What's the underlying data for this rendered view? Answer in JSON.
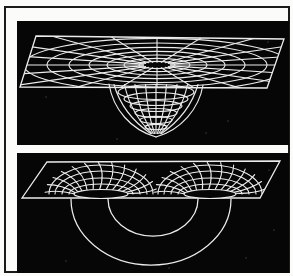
{
  "meta": {
    "kind": "scanned-textbook-figure",
    "visible_text": []
  },
  "colors": {
    "page_background": "#fbfbf9",
    "frame_border": "#1a1a1a",
    "panel_background": "#060606",
    "line": "#ececec",
    "speck": "#3d3d3d"
  },
  "figure": {
    "panels": [
      {
        "name": "gravity-well",
        "size": [
          272,
          124
        ],
        "sheet": [
          [
            19,
            15
          ],
          [
            267,
            18
          ],
          [
            250,
            67
          ],
          [
            3,
            66
          ]
        ],
        "grid_center": [
          140,
          44
        ],
        "grid_flatten": 0.2,
        "grid_radii": [
          18,
          33,
          50,
          68,
          88,
          110,
          133
        ],
        "ray_count": 20,
        "ray_inner": 14,
        "ray_outer": 175,
        "mouth": {
          "cx": 139,
          "cy": 60,
          "rx": 50,
          "ry": 11
        },
        "funnel": {
          "tip": [
            139,
            116
          ],
          "left": [
            92,
            63
          ],
          "right": [
            186,
            64
          ],
          "rings": [
            [
              71,
              38,
              7.5
            ],
            [
              78,
              32,
              6.5
            ],
            [
              85,
              26,
              5.5
            ],
            [
              92,
              21,
              4.5
            ],
            [
              99,
              16,
              3.6
            ],
            [
              106,
              11,
              2.7
            ]
          ],
          "meridians": 9,
          "half_width": 42
        },
        "specks": [
          [
            29,
            76
          ],
          [
            211,
            100
          ],
          [
            251,
            21
          ],
          [
            189,
            112
          ],
          [
            100,
            118
          ]
        ]
      },
      {
        "name": "wormhole",
        "size": [
          272,
          120
        ],
        "sheet": [
          [
            30,
            9
          ],
          [
            263,
            8
          ],
          [
            243,
            45
          ],
          [
            5,
            45
          ]
        ],
        "mouths": [
          {
            "cx": 84,
            "cy": 41,
            "rx": 27,
            "ry": 4.5
          },
          {
            "cx": 193,
            "cy": 41,
            "rx": 26,
            "ry": 4.5
          }
        ],
        "fan_arcs": [
          [
            32,
            10
          ],
          [
            39,
            16
          ],
          [
            46,
            23
          ],
          [
            52,
            29
          ]
        ],
        "ray_angles_deg": [
          183,
          197,
          211,
          225,
          239,
          253,
          267,
          281,
          295,
          309,
          323,
          337,
          351
        ],
        "ray_end": [
          56,
          32
        ],
        "swirl_deg": 9,
        "tube_outer": {
          "x1": 54,
          "x2": 214,
          "y": 46,
          "depth": 66
        },
        "tube_inner": {
          "x1": 91,
          "x2": 181,
          "y": 46,
          "depth": 37
        },
        "specks": [
          [
            252,
            17
          ],
          [
            229,
            105
          ],
          [
            49,
            108
          ],
          [
            257,
            77
          ],
          [
            152,
            115
          ]
        ]
      }
    ]
  }
}
